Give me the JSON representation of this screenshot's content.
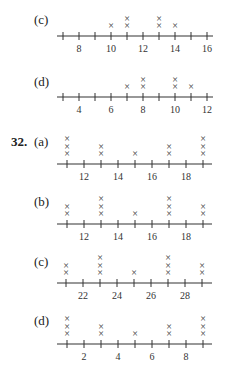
{
  "chart_data": [
    {
      "type": "dot_plot",
      "problem": "",
      "part": "(c)",
      "axis": {
        "min": 7,
        "max": 16,
        "tick_step": 1,
        "labels": [
          8,
          10,
          12,
          14,
          16
        ]
      },
      "points": [
        {
          "x": 10,
          "count": 1
        },
        {
          "x": 11,
          "count": 2
        },
        {
          "x": 13,
          "count": 2
        },
        {
          "x": 14,
          "count": 1
        }
      ]
    },
    {
      "type": "dot_plot",
      "problem": "",
      "part": "(d)",
      "axis": {
        "min": 3,
        "max": 12,
        "tick_step": 1,
        "labels": [
          4,
          6,
          8,
          10,
          12
        ]
      },
      "points": [
        {
          "x": 7,
          "count": 1
        },
        {
          "x": 8,
          "count": 2
        },
        {
          "x": 10,
          "count": 2
        },
        {
          "x": 11,
          "count": 1
        }
      ]
    },
    {
      "type": "dot_plot",
      "problem": "32.",
      "part": "(a)",
      "axis": {
        "min": 11,
        "max": 19,
        "tick_step": 1,
        "labels": [
          12,
          14,
          16,
          18
        ]
      },
      "points": [
        {
          "x": 11,
          "count": 3
        },
        {
          "x": 13,
          "count": 2
        },
        {
          "x": 15,
          "count": 1
        },
        {
          "x": 17,
          "count": 2
        },
        {
          "x": 19,
          "count": 3
        }
      ]
    },
    {
      "type": "dot_plot",
      "problem": "",
      "part": "(b)",
      "axis": {
        "min": 11,
        "max": 19,
        "tick_step": 1,
        "labels": [
          12,
          14,
          16,
          18
        ]
      },
      "points": [
        {
          "x": 11,
          "count": 2
        },
        {
          "x": 13,
          "count": 3
        },
        {
          "x": 15,
          "count": 1
        },
        {
          "x": 17,
          "count": 3
        },
        {
          "x": 19,
          "count": 2
        }
      ]
    },
    {
      "type": "dot_plot",
      "problem": "",
      "part": "(c)",
      "axis": {
        "min": 21,
        "max": 29,
        "tick_step": 1,
        "labels": [
          22,
          24,
          26,
          28
        ]
      },
      "points": [
        {
          "x": 21,
          "count": 2
        },
        {
          "x": 23,
          "count": 3
        },
        {
          "x": 25,
          "count": 1
        },
        {
          "x": 27,
          "count": 3
        },
        {
          "x": 29,
          "count": 2
        }
      ]
    },
    {
      "type": "dot_plot",
      "problem": "",
      "part": "(d)",
      "axis": {
        "min": 1,
        "max": 9,
        "tick_step": 1,
        "labels": [
          2,
          4,
          6,
          8
        ]
      },
      "points": [
        {
          "x": 1,
          "count": 3
        },
        {
          "x": 3,
          "count": 2
        },
        {
          "x": 5,
          "count": 1
        },
        {
          "x": 7,
          "count": 2
        },
        {
          "x": 9,
          "count": 3
        }
      ]
    }
  ],
  "labels": {
    "p0": "(c)",
    "p1": "(d)",
    "num32": "32.",
    "p2": "(a)",
    "p3": "(b)",
    "p4": "(c)",
    "p5": "(d)"
  },
  "marker": "×"
}
